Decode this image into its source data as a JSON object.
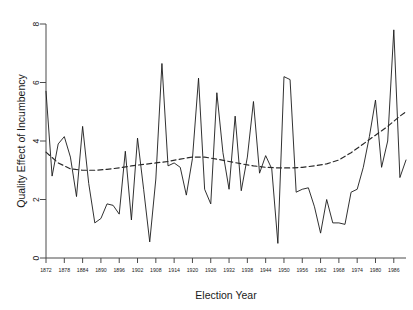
{
  "chart_data": {
    "type": "line",
    "title": "",
    "xlabel": "Election Year",
    "ylabel": "Quality Effect of Incumbency",
    "xlim": [
      1872,
      1990
    ],
    "ylim": [
      0,
      8
    ],
    "grid": false,
    "legend": "none",
    "xticks": [
      1872,
      1878,
      1884,
      1890,
      1896,
      1902,
      1908,
      1914,
      1920,
      1926,
      1932,
      1938,
      1944,
      1950,
      1956,
      1962,
      1968,
      1974,
      1980,
      1986
    ],
    "yticks": [
      0,
      2,
      4,
      6,
      8
    ],
    "series": [
      {
        "name": "Quality effect of incumbency",
        "style": "solid",
        "color": "#1a1a1a",
        "x": [
          1872,
          1874,
          1876,
          1878,
          1880,
          1882,
          1884,
          1886,
          1888,
          1890,
          1892,
          1894,
          1896,
          1898,
          1900,
          1902,
          1904,
          1906,
          1908,
          1910,
          1912,
          1914,
          1916,
          1918,
          1920,
          1922,
          1924,
          1926,
          1928,
          1930,
          1932,
          1934,
          1936,
          1938,
          1940,
          1942,
          1944,
          1946,
          1948,
          1950,
          1952,
          1954,
          1956,
          1958,
          1960,
          1962,
          1964,
          1966,
          1968,
          1970,
          1972,
          1974,
          1976,
          1978,
          1980,
          1982,
          1984,
          1986,
          1988,
          1990
        ],
        "values": [
          5.7,
          2.8,
          3.9,
          4.15,
          3.45,
          2.1,
          4.5,
          2.55,
          1.2,
          1.35,
          1.85,
          1.8,
          1.5,
          3.65,
          1.3,
          4.1,
          2.35,
          0.55,
          2.7,
          6.65,
          3.15,
          3.25,
          3.1,
          2.15,
          3.4,
          6.15,
          2.35,
          1.85,
          5.65,
          3.6,
          2.35,
          4.85,
          2.3,
          3.45,
          5.35,
          2.9,
          3.5,
          3.05,
          0.5,
          6.2,
          6.1,
          2.25,
          2.35,
          2.4,
          1.75,
          0.85,
          2.0,
          1.2,
          1.2,
          1.15,
          2.25,
          2.35,
          3.1,
          4.15,
          5.4,
          3.1,
          4.0,
          7.8,
          2.75,
          3.35
        ]
      },
      {
        "name": "Smoothed trend",
        "style": "dashed",
        "color": "#2a2a2a",
        "x": [
          1872,
          1876,
          1880,
          1884,
          1888,
          1892,
          1896,
          1900,
          1904,
          1908,
          1912,
          1916,
          1920,
          1924,
          1928,
          1932,
          1936,
          1940,
          1944,
          1948,
          1952,
          1956,
          1960,
          1964,
          1968,
          1972,
          1976,
          1980,
          1984,
          1988,
          1990
        ],
        "values": [
          3.62,
          3.25,
          3.05,
          3.0,
          3.0,
          3.03,
          3.08,
          3.15,
          3.2,
          3.25,
          3.3,
          3.38,
          3.45,
          3.45,
          3.38,
          3.3,
          3.22,
          3.15,
          3.1,
          3.08,
          3.08,
          3.1,
          3.15,
          3.22,
          3.35,
          3.6,
          3.9,
          4.2,
          4.5,
          4.85,
          5.0
        ]
      }
    ]
  },
  "axes": {
    "x_title": "Election Year",
    "y_title": "Quality Effect of Incumbency"
  }
}
